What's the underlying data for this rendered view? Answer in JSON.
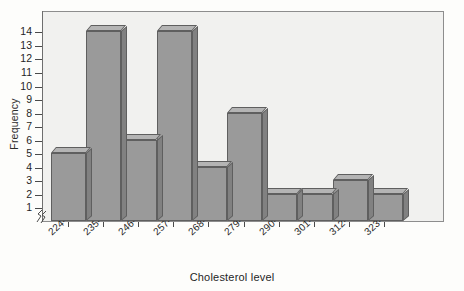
{
  "chart_data": {
    "type": "bar",
    "title": "",
    "xlabel": "Cholesterol level",
    "ylabel": "Frequency",
    "categories": [
      "224–234",
      "235–245",
      "246–256",
      "257–267",
      "268–278",
      "279–289",
      "290–300",
      "301–311",
      "312–322",
      "323–333"
    ],
    "values": [
      5,
      14,
      6,
      14,
      4,
      8,
      2,
      2,
      3,
      2
    ],
    "ylim": [
      0,
      14
    ],
    "yticks": [
      1,
      2,
      3,
      4,
      5,
      6,
      7,
      8,
      9,
      10,
      11,
      12,
      13,
      14
    ],
    "ytick_labels": [
      "1",
      "2",
      "3",
      "4",
      "5",
      "6",
      "7",
      "8",
      "9",
      "10",
      "11",
      "12",
      "13",
      "14"
    ],
    "grid": false,
    "legend": null,
    "axis_break": "y-axis break symbol at origin",
    "style": "3d-bars",
    "colors": {
      "bar_front": "#9a9a9a",
      "bar_top": "#b4b4b4",
      "bar_side": "#818181",
      "bar_edge": "#5f5f5f",
      "plot_background": "#f1f1ef",
      "frame": "#8d8d8d",
      "text": "#1f1f1f"
    }
  }
}
